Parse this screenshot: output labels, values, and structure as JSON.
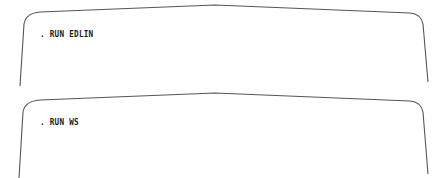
{
  "screens": [
    {
      "prompt_char": ".",
      "command": "RUN EDLIN",
      "line": ". RUN EDLIN"
    },
    {
      "prompt_char": ".",
      "command": "RUN WS",
      "line": ". RUN WS"
    }
  ],
  "colors": {
    "frame_stroke": "#555555",
    "text": "#1a1a1a",
    "background": "#ffffff"
  }
}
